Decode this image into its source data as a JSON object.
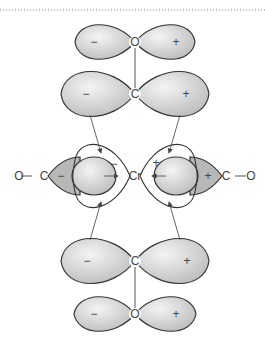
{
  "diagram": {
    "top_co": {
      "atom_o": "O",
      "atom_c": "C",
      "o_signs": [
        "−",
        "+"
      ],
      "c_signs": [
        "−",
        "+"
      ]
    },
    "middle": {
      "metal": "Cr",
      "left_ligand": {
        "o": "O",
        "c": "C",
        "sign": "−",
        "lobe_sign": "−"
      },
      "right_ligand": {
        "o": "O",
        "c": "C",
        "sign": "+",
        "lobe_sign": "+"
      }
    },
    "bottom_co": {
      "atom_c": "C",
      "atom_o": "O",
      "c_signs": [
        "−",
        "+"
      ],
      "o_signs": [
        "−",
        "+"
      ]
    },
    "colors": {
      "lobe_fill": "#c8c8c8",
      "lobe_stroke": "#333333",
      "line": "#555555"
    }
  }
}
